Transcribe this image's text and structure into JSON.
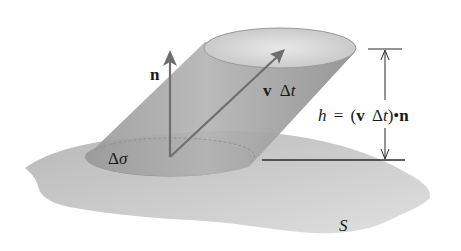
{
  "figure": {
    "labels": {
      "normal_vector": "n",
      "velocity_displacement": "v Δt",
      "velocity_v": "v",
      "velocity_delta": "Δ",
      "velocity_t": "t",
      "area_element": "Δσ",
      "area_delta": "Δ",
      "area_sigma": "σ",
      "surface": "S",
      "height_h": "h",
      "height_eq": "=",
      "height_open": "(",
      "height_v": "v",
      "height_delta": "Δ",
      "height_t": "t",
      "height_close": ")",
      "height_dot": "•",
      "height_n": "n"
    },
    "height_formula": "h = (v Δt)•n",
    "colors": {
      "surface": "#c8c8c8",
      "cylinder": "#a8a8a8",
      "cylinder_dark": "#8c8c8c",
      "top_ellipse": "#d6d6d6",
      "base_ellipse": "#b2b2b2",
      "arrow": "#6e6e6e",
      "dimension_line": "#2a2a2a",
      "text": "#1a1a1a"
    }
  }
}
